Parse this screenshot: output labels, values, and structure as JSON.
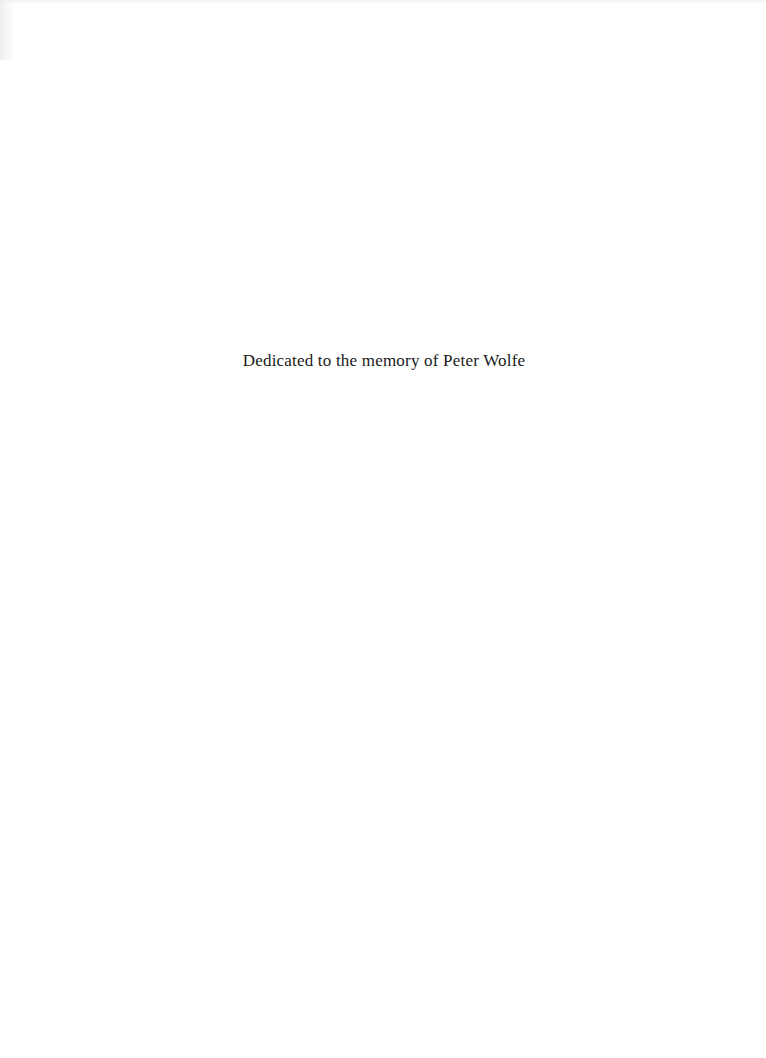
{
  "page": {
    "type": "dedication-page",
    "dedication_text": "Dedicated to the memory of Peter Wolfe"
  }
}
